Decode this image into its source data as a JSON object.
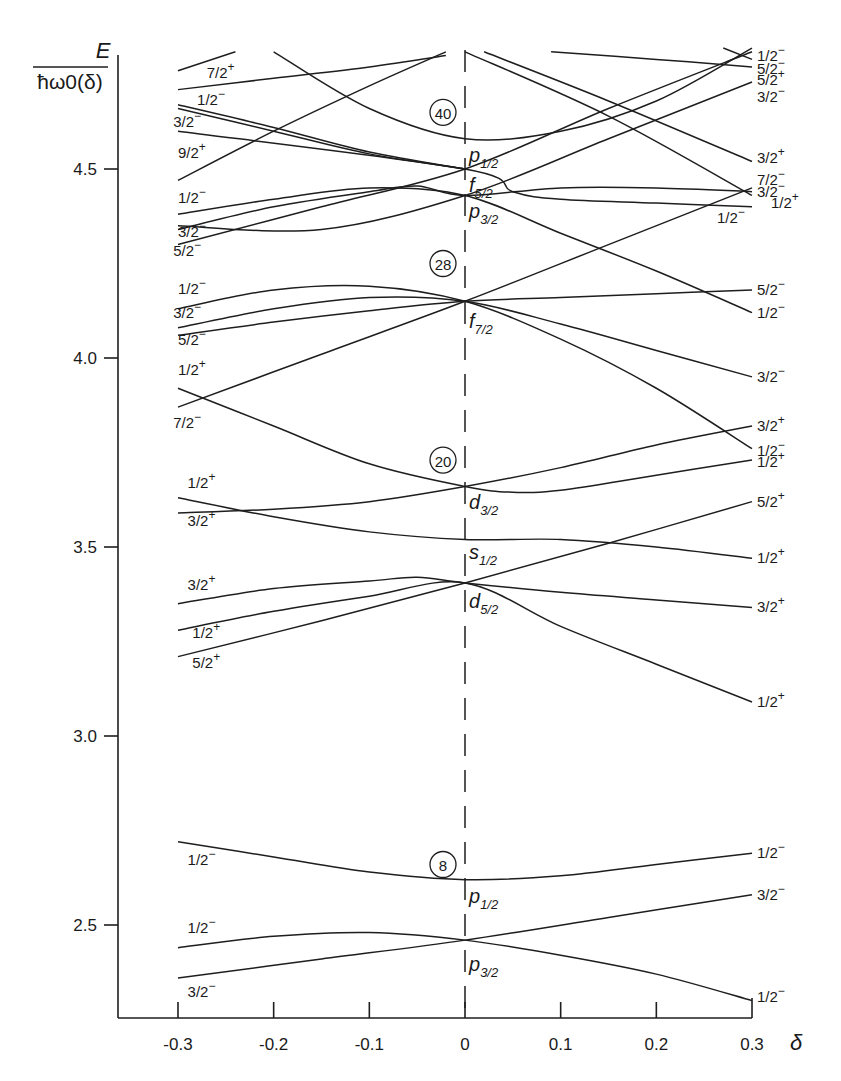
{
  "chart_data": {
    "type": "line",
    "title": "",
    "xlabel": "δ",
    "ylabel": "E / ħω0(δ)",
    "ylabel_numerator": "E",
    "ylabel_denominator": "ħω0(δ)",
    "xlim": [
      -0.36,
      0.3
    ],
    "ylim": [
      2.25,
      4.82
    ],
    "grid": false,
    "legend": "none",
    "x_ticks": [
      -0.3,
      -0.2,
      -0.1,
      0,
      0.1,
      0.2,
      0.3
    ],
    "x_tick_labels": [
      "-0.3",
      "-0.2",
      "-0.1",
      "0",
      "0.1",
      "0.2",
      "0.3"
    ],
    "y_ticks": [
      2.5,
      3.0,
      3.5,
      4.0,
      4.5
    ],
    "y_tick_labels": [
      "2.5",
      "3.0",
      "3.5",
      "4.0",
      "4.5"
    ],
    "magic_numbers": [
      {
        "label": "8",
        "delta": -0.023,
        "E": 2.66
      },
      {
        "label": "20",
        "delta": -0.023,
        "E": 3.73
      },
      {
        "label": "28",
        "delta": -0.023,
        "E": 4.25
      },
      {
        "label": "40",
        "delta": -0.023,
        "E": 4.65
      }
    ],
    "spherical_orbitals": [
      {
        "label": "p",
        "sub": "1/2",
        "E": 2.62,
        "text_E": 2.57
      },
      {
        "label": "p",
        "sub": "3/2",
        "E": 2.46,
        "text_E": 2.39
      },
      {
        "label": "d",
        "sub": "5/2",
        "E": 3.405,
        "text_E": 3.35
      },
      {
        "label": "s",
        "sub": "1/2",
        "E": 3.52,
        "text_E": 3.48
      },
      {
        "label": "d",
        "sub": "3/2",
        "E": 3.66,
        "text_E": 3.61
      },
      {
        "label": "f",
        "sub": "7/2",
        "E": 4.15,
        "text_E": 4.09
      },
      {
        "label": "p",
        "sub": "3/2",
        "E": 4.43,
        "text_E": 4.38
      },
      {
        "label": "f",
        "sub": "5/2",
        "E": 4.5,
        "text_E": 4.45
      },
      {
        "label": "p",
        "sub": "1/2",
        "E": 4.58,
        "text_E": 4.53
      }
    ],
    "series": [
      {
        "name": "p3/2 Ω=3/2-",
        "left_label": "3/2−",
        "right_label": "3/2−",
        "x": [
          -0.3,
          -0.15,
          0,
          0.15,
          0.3
        ],
        "values": [
          2.36,
          2.41,
          2.46,
          2.52,
          2.58
        ]
      },
      {
        "name": "p3/2 Ω=1/2-",
        "left_label": "1/2−",
        "right_label": "1/2−",
        "x": [
          -0.3,
          -0.2,
          -0.1,
          0,
          0.1,
          0.2,
          0.3
        ],
        "values": [
          2.44,
          2.47,
          2.48,
          2.46,
          2.42,
          2.37,
          2.3
        ]
      },
      {
        "name": "p1/2 Ω=1/2-",
        "left_label": "1/2−",
        "right_label": "1/2−",
        "x": [
          -0.3,
          -0.2,
          -0.1,
          0,
          0.1,
          0.2,
          0.3
        ],
        "values": [
          2.72,
          2.68,
          2.64,
          2.62,
          2.63,
          2.66,
          2.69
        ]
      },
      {
        "name": "d5/2 Ω=5/2+",
        "left_label": "5/2+",
        "right_label": "5/2+",
        "x": [
          -0.3,
          -0.15,
          0,
          0.15,
          0.3
        ],
        "values": [
          3.21,
          3.305,
          3.405,
          3.51,
          3.62
        ]
      },
      {
        "name": "d5/2 Ω=1/2+ (left)",
        "left_label": "1/2+",
        "right_label": "1/2+",
        "x": [
          -0.3,
          -0.2,
          -0.1,
          0,
          0.1,
          0.2,
          0.3
        ],
        "values": [
          3.28,
          3.33,
          3.37,
          3.405,
          3.29,
          3.19,
          3.09
        ]
      },
      {
        "name": "d5/2 Ω=3/2+",
        "left_label": "3/2+",
        "right_label": "3/2+",
        "x": [
          -0.3,
          -0.2,
          -0.1,
          -0.05,
          0,
          0.1,
          0.2,
          0.3
        ],
        "values": [
          3.35,
          3.39,
          3.41,
          3.42,
          3.405,
          3.38,
          3.36,
          3.34
        ]
      },
      {
        "name": "s1/2 Ω=1/2+",
        "left_label": "1/2+",
        "right_label": "1/2+",
        "x": [
          -0.3,
          -0.2,
          -0.1,
          0,
          0.1,
          0.2,
          0.3
        ],
        "values": [
          3.63,
          3.58,
          3.54,
          3.52,
          3.52,
          3.5,
          3.47
        ]
      },
      {
        "name": "d3/2 Ω=3/2+",
        "left_label": "3/2+",
        "right_label": "3/2+",
        "x": [
          -0.3,
          -0.2,
          -0.1,
          0,
          0.1,
          0.2,
          0.3
        ],
        "values": [
          3.59,
          3.6,
          3.62,
          3.66,
          3.71,
          3.77,
          3.82
        ]
      },
      {
        "name": "d3/2 Ω=1/2+",
        "left_label": "",
        "right_label": "1/2+",
        "x": [
          -0.3,
          -0.2,
          -0.1,
          0,
          0.05,
          0.1,
          0.2,
          0.3
        ],
        "values": [
          3.92,
          3.82,
          3.72,
          3.66,
          3.645,
          3.65,
          3.69,
          3.73
        ]
      },
      {
        "name": "f7/2 Ω=7/2-",
        "left_label": "7/2−",
        "right_label": "7/2−",
        "x": [
          -0.3,
          -0.15,
          0,
          0.15,
          0.3
        ],
        "values": [
          3.87,
          4.01,
          4.15,
          4.3,
          4.45
        ]
      },
      {
        "name": "f7/2 Ω=5/2-",
        "left_label": "5/2−",
        "right_label": "5/2−",
        "x": [
          -0.3,
          -0.2,
          -0.1,
          0,
          0.1,
          0.2,
          0.3
        ],
        "values": [
          4.06,
          4.095,
          4.125,
          4.15,
          4.16,
          4.17,
          4.18
        ]
      },
      {
        "name": "f7/2 Ω=3/2-",
        "left_label": "3/2−",
        "right_label": "3/2−",
        "x": [
          -0.3,
          -0.2,
          -0.1,
          0,
          0.1,
          0.2,
          0.3
        ],
        "values": [
          4.08,
          4.13,
          4.16,
          4.15,
          4.09,
          4.02,
          3.95
        ]
      },
      {
        "name": "f7/2 Ω=1/2-",
        "left_label": "1/2−",
        "right_label": "1/2−",
        "x": [
          -0.3,
          -0.2,
          -0.1,
          0,
          0.1,
          0.2,
          0.3
        ],
        "values": [
          4.13,
          4.18,
          4.19,
          4.15,
          4.05,
          3.92,
          3.76
        ]
      },
      {
        "name": "p3/2 Ω=3/2-",
        "left_label": "3/2−",
        "right_label": "3/2−",
        "x": [
          -0.3,
          -0.15,
          0,
          0.15,
          0.3
        ],
        "values": [
          4.35,
          4.34,
          4.43,
          4.58,
          4.73
        ]
      },
      {
        "name": "f5/2 Ω=5/2-",
        "left_label": "5/2−",
        "right_label": "5/2−",
        "x": [
          -0.3,
          -0.15,
          0,
          0.15,
          0.3
        ],
        "values": [
          4.3,
          4.4,
          4.5,
          4.66,
          4.81
        ]
      },
      {
        "name": "p3/2 Ω=1/2-",
        "left_label": "1/2−",
        "right_label": "1/2+",
        "x": [
          -0.3,
          -0.2,
          -0.1,
          0,
          0.1,
          0.2,
          0.3
        ],
        "values": [
          4.38,
          4.42,
          4.45,
          4.43,
          4.33,
          4.23,
          4.12
        ]
      },
      {
        "name": "f5/2 Ω=3/2-",
        "left_label": "",
        "right_label": "3/2−",
        "x": [
          -0.3,
          -0.2,
          -0.1,
          -0.05,
          0,
          0.1,
          0.2,
          0.3
        ],
        "values": [
          4.34,
          4.4,
          4.44,
          4.455,
          4.43,
          4.45,
          4.45,
          4.44
        ]
      },
      {
        "name": "f5/2 Ω=1/2-",
        "left_label": "",
        "right_label": "1/2−",
        "x": [
          -0.3,
          0,
          0.05,
          0.1,
          0.2,
          0.3
        ],
        "values": [
          4.6,
          4.5,
          4.44,
          4.42,
          4.41,
          4.4
        ]
      },
      {
        "name": "p1/2 Ω=1/2-",
        "left_label": "",
        "right_label": "1/2−",
        "x": [
          -0.2,
          -0.1,
          0,
          0.1,
          0.2,
          0.3
        ],
        "values": [
          4.81,
          4.66,
          4.58,
          4.6,
          4.68,
          4.82
        ]
      },
      {
        "name": "g9/2 Ω=9/2+",
        "left_label": "9/2+",
        "right_label": "",
        "x": [
          -0.3,
          -0.2,
          -0.1,
          -0.02
        ],
        "values": [
          4.47,
          4.6,
          4.72,
          4.81
        ]
      },
      {
        "name": "g9/2 Ω=7/2+",
        "left_label": "7/2+",
        "right_label": "",
        "x": [
          -0.3,
          -0.2,
          -0.1,
          -0.02
        ],
        "values": [
          4.71,
          4.74,
          4.77,
          4.8
        ]
      },
      {
        "name": "g9/2 Ω=3/2- (left group)",
        "left_label": "3/2−",
        "right_label": "",
        "x": [
          -0.3,
          -0.2,
          -0.1,
          0
        ],
        "values": [
          4.66,
          4.6,
          4.54,
          4.5
        ]
      },
      {
        "name": "g9/2 Ω=1/2- (left group)",
        "left_label": "1/2−",
        "right_label": "",
        "x": [
          -0.3,
          -0.2,
          -0.1,
          0
        ],
        "values": [
          4.67,
          4.61,
          4.545,
          4.5
        ]
      },
      {
        "name": "upper-left segment",
        "left_label": "",
        "right_label": "",
        "x": [
          -0.3,
          -0.24
        ],
        "values": [
          4.76,
          4.81
        ]
      },
      {
        "name": "descending from top 3/2+",
        "left_label": "",
        "right_label": "3/2+",
        "x": [
          0.02,
          0.15,
          0.3
        ],
        "values": [
          4.81,
          4.68,
          4.52
        ]
      },
      {
        "name": "descending from top 1/2+",
        "left_label": "",
        "right_label": "1/2+",
        "x": [
          0.0,
          0.15,
          0.3
        ],
        "values": [
          4.81,
          4.64,
          4.43
        ]
      },
      {
        "name": "top right 5/2+",
        "left_label": "",
        "right_label": "5/2+",
        "x": [
          0.09,
          0.2,
          0.3
        ],
        "values": [
          4.81,
          4.79,
          4.77
        ]
      },
      {
        "name": "top right 1/2-",
        "left_label": "",
        "right_label": "1/2−",
        "x": [
          0.27,
          0.3
        ],
        "values": [
          4.82,
          4.79
        ]
      }
    ],
    "left_labels": [
      {
        "text": "7/2",
        "sign": "+",
        "delta": -0.27,
        "E": 4.74
      },
      {
        "text": "1/2",
        "sign": "−",
        "delta": -0.28,
        "E": 4.67
      },
      {
        "text": "3/2",
        "sign": "−",
        "delta": -0.305,
        "E": 4.61
      },
      {
        "text": "9/2",
        "sign": "+",
        "delta": -0.3,
        "E": 4.53
      },
      {
        "text": "1/2",
        "sign": "−",
        "delta": -0.3,
        "E": 4.41
      },
      {
        "text": "3/2",
        "sign": "−",
        "delta": -0.3,
        "E": 4.32
      },
      {
        "text": "5/2",
        "sign": "−",
        "delta": -0.305,
        "E": 4.27
      },
      {
        "text": "1/2",
        "sign": "−",
        "delta": -0.3,
        "E": 4.17
      },
      {
        "text": "3/2",
        "sign": "−",
        "delta": -0.305,
        "E": 4.105
      },
      {
        "text": "5/2",
        "sign": "−",
        "delta": -0.3,
        "E": 4.035
      },
      {
        "text": "1/2",
        "sign": "+",
        "delta": -0.3,
        "E": 3.955
      },
      {
        "text": "7/2",
        "sign": "−",
        "delta": -0.305,
        "E": 3.815
      },
      {
        "text": "1/2",
        "sign": "+",
        "delta": -0.29,
        "E": 3.655
      },
      {
        "text": "3/2",
        "sign": "+",
        "delta": -0.29,
        "E": 3.555
      },
      {
        "text": "3/2",
        "sign": "+",
        "delta": -0.29,
        "E": 3.385
      },
      {
        "text": "1/2",
        "sign": "+",
        "delta": -0.285,
        "E": 3.26
      },
      {
        "text": "5/2",
        "sign": "+",
        "delta": -0.285,
        "E": 3.18
      },
      {
        "text": "1/2",
        "sign": "−",
        "delta": -0.29,
        "E": 2.66
      },
      {
        "text": "1/2",
        "sign": "−",
        "delta": -0.29,
        "E": 2.48
      },
      {
        "text": "3/2",
        "sign": "−",
        "delta": -0.29,
        "E": 2.31
      }
    ],
    "right_labels": [
      {
        "text": "1/2",
        "sign": "−",
        "E": 4.8
      },
      {
        "text": "5/2",
        "sign": "−",
        "E": 4.765
      },
      {
        "text": "5/2",
        "sign": "+",
        "E": 4.735
      },
      {
        "text": "3/2",
        "sign": "−",
        "E": 4.69
      },
      {
        "text": "3/2",
        "sign": "+",
        "E": 4.53
      },
      {
        "text": "7/2",
        "sign": "−",
        "E": 4.47
      },
      {
        "text": "3/2",
        "sign": "−",
        "E": 4.44
      },
      {
        "text": "1/2",
        "sign": "+",
        "E": 4.41,
        "dx": 14
      },
      {
        "text": "1/2",
        "sign": "−",
        "E": 4.37,
        "dx": -40
      },
      {
        "text": "5/2",
        "sign": "−",
        "E": 4.18
      },
      {
        "text": "1/2",
        "sign": "−",
        "E": 4.12
      },
      {
        "text": "3/2",
        "sign": "−",
        "E": 3.95
      },
      {
        "text": "3/2",
        "sign": "+",
        "E": 3.82
      },
      {
        "text": "1/2",
        "sign": "−",
        "E": 3.755
      },
      {
        "text": "1/2",
        "sign": "+",
        "E": 3.725
      },
      {
        "text": "5/2",
        "sign": "+",
        "E": 3.62
      },
      {
        "text": "1/2",
        "sign": "+",
        "E": 3.47
      },
      {
        "text": "3/2",
        "sign": "+",
        "E": 3.34
      },
      {
        "text": "1/2",
        "sign": "+",
        "E": 3.09
      },
      {
        "text": "1/2",
        "sign": "−",
        "E": 2.69
      },
      {
        "text": "3/2",
        "sign": "−",
        "E": 2.58
      },
      {
        "text": "1/2",
        "sign": "−",
        "E": 2.31
      }
    ]
  }
}
